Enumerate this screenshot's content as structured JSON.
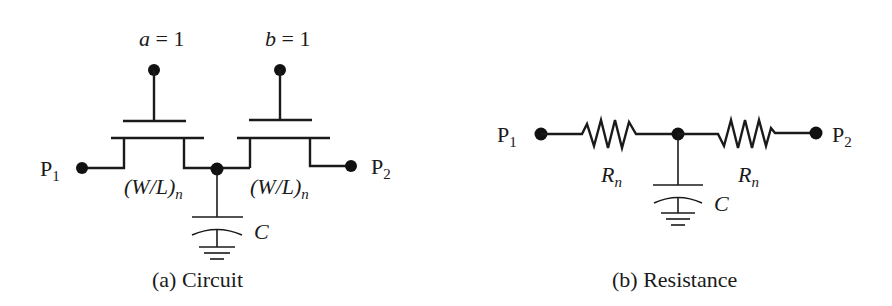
{
  "figure_a": {
    "caption": "(a)  Circuit",
    "inputs": [
      {
        "var": "a",
        "eq": " = 1"
      },
      {
        "var": "b",
        "eq": " = 1"
      }
    ],
    "ports": {
      "left": "P",
      "left_sub": "1",
      "right": "P",
      "right_sub": "2"
    },
    "transistor_label": {
      "main": "(W/L)",
      "sub": "n"
    },
    "capacitor_label": "C"
  },
  "figure_b": {
    "caption": "(b) Resistance",
    "ports": {
      "left": "P",
      "left_sub": "1",
      "right": "P",
      "right_sub": "2"
    },
    "resistor_label": {
      "main": "R",
      "sub": "n"
    },
    "capacitor_label": "C"
  },
  "colors": {
    "ink": "#1a1a1a",
    "background": "#ffffff"
  }
}
